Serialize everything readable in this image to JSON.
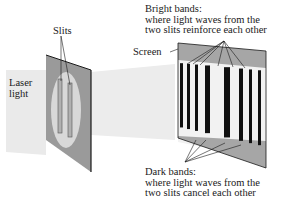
{
  "diagram": {
    "labels": {
      "laser": [
        "Laser",
        "light"
      ],
      "slits": "Slits",
      "screen": "Screen",
      "bright_heading": "Bright bands:",
      "bright_desc": [
        "where light waves from the",
        "two slits reinforce each other"
      ],
      "dark_heading": "Dark bands:",
      "dark_desc": [
        "where light waves from the",
        "two slits cancel each other"
      ]
    },
    "colors": {
      "beam": "#e9e9e9",
      "panel": "#9a9a9a",
      "panel_edge": "#1a1a1a",
      "halo": "#d8d8d8",
      "screen_light": "#f2f2f2",
      "screen_shade": "#a6a6a6",
      "band": "#111111",
      "text": "#1a1a1a"
    },
    "bands": [
      {
        "x": 180,
        "w": 3
      },
      {
        "x": 187,
        "w": 3
      },
      {
        "x": 195,
        "w": 3
      },
      {
        "x": 205,
        "w": 5
      },
      {
        "x": 224,
        "w": 6
      },
      {
        "x": 239,
        "w": 4
      },
      {
        "x": 249,
        "w": 3
      },
      {
        "x": 258,
        "w": 3
      }
    ]
  }
}
